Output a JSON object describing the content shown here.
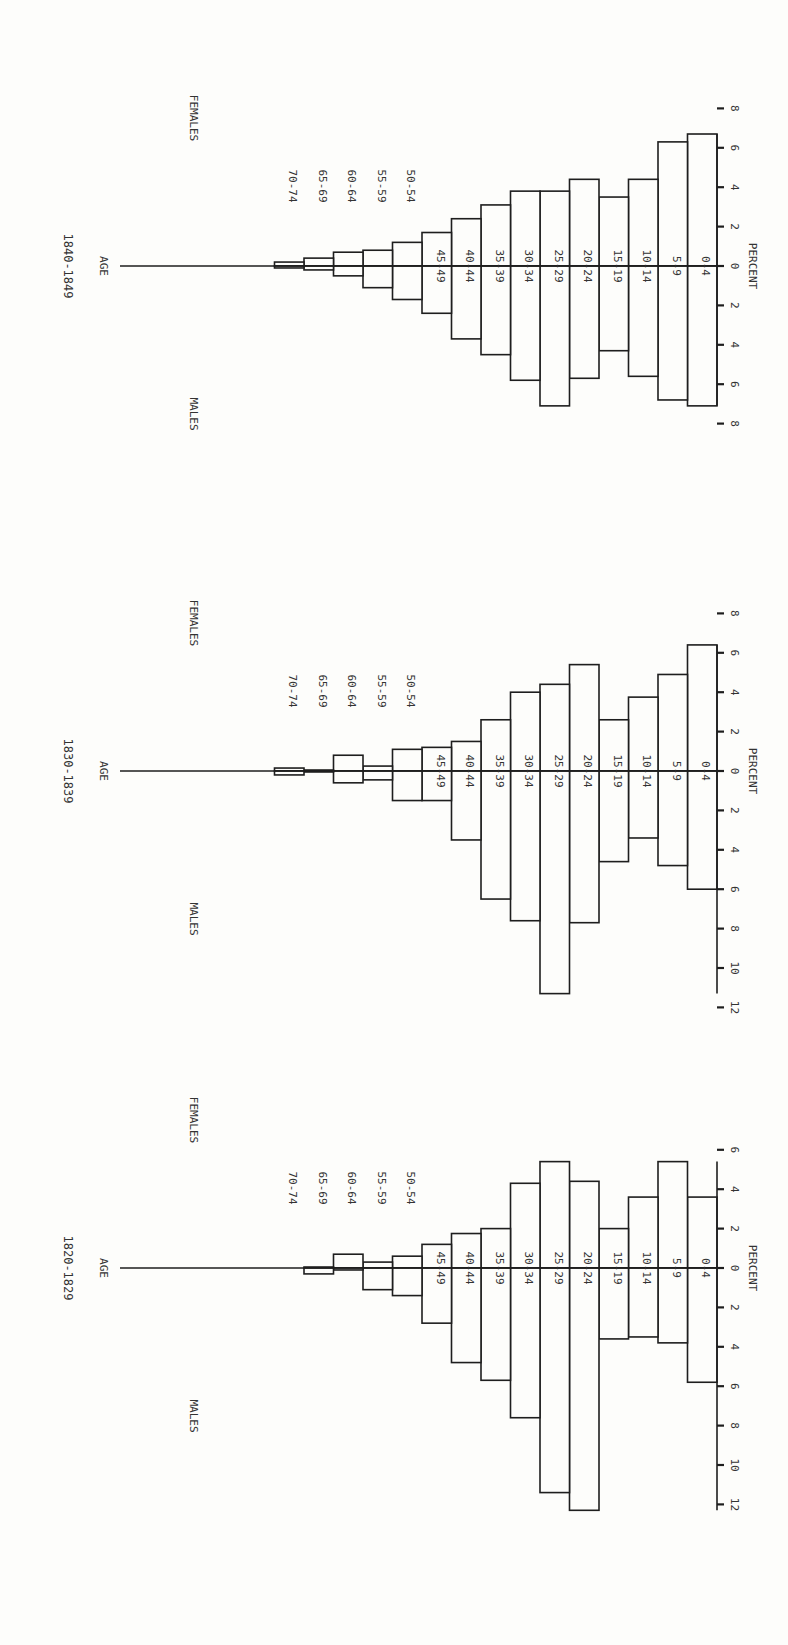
{
  "labels": {
    "age": "AGE",
    "males": "MALES",
    "females": "FEMALES",
    "percent": "PERCENT"
  },
  "chart_data": [
    {
      "type": "bar",
      "subtype": "population-pyramid",
      "title": "1840-1849",
      "orientation_note": "page rotated 90° clockwise; age increases toward the left edge, females toward top, males toward bottom",
      "categories": [
        "0-4",
        "5-9",
        "10-14",
        "15-19",
        "20-24",
        "25-29",
        "30-34",
        "35-39",
        "40-44",
        "45-49",
        "50-54",
        "55-59",
        "60-64",
        "65-69",
        "70-74"
      ],
      "series": [
        {
          "name": "MALES",
          "values": [
            7.1,
            6.8,
            5.6,
            4.3,
            5.7,
            7.1,
            5.8,
            4.5,
            3.7,
            2.4,
            1.7,
            1.1,
            0.5,
            0.2,
            0.1
          ]
        },
        {
          "name": "FEMALES",
          "values": [
            6.7,
            6.3,
            4.4,
            3.5,
            4.4,
            3.8,
            3.8,
            3.1,
            2.4,
            1.7,
            1.2,
            0.8,
            0.7,
            0.4,
            0.2
          ]
        }
      ],
      "xlabel": "PERCENT",
      "ylabel": "AGE",
      "male_ticks": [
        2,
        4,
        6,
        8
      ],
      "female_ticks": [
        2,
        4,
        6,
        8
      ],
      "xlim_males": [
        0,
        8
      ],
      "xlim_females": [
        0,
        8
      ],
      "grid": false
    },
    {
      "type": "bar",
      "subtype": "population-pyramid",
      "title": "1830-1839",
      "categories": [
        "0-4",
        "5-9",
        "10-14",
        "15-19",
        "20-24",
        "25-29",
        "30-34",
        "35-39",
        "40-44",
        "45-49",
        "50-54",
        "55-59",
        "60-64",
        "65-69",
        "70-74"
      ],
      "series": [
        {
          "name": "MALES",
          "values": [
            6.0,
            4.8,
            3.4,
            4.6,
            7.7,
            11.3,
            7.6,
            6.5,
            3.5,
            1.5,
            1.5,
            0.45,
            0.6,
            0.05,
            0.2
          ]
        },
        {
          "name": "FEMALES",
          "values": [
            6.4,
            4.9,
            3.75,
            2.6,
            5.4,
            4.4,
            4.0,
            2.6,
            1.5,
            1.2,
            1.1,
            0.25,
            0.8,
            0.05,
            0.15
          ]
        }
      ],
      "xlabel": "PERCENT",
      "ylabel": "AGE",
      "male_ticks": [
        2,
        4,
        6,
        8,
        10,
        12
      ],
      "female_ticks": [
        2,
        4,
        6,
        8
      ],
      "xlim_males": [
        0,
        12
      ],
      "xlim_females": [
        0,
        8
      ],
      "grid": false
    },
    {
      "type": "bar",
      "subtype": "population-pyramid",
      "title": "1820-1829",
      "categories": [
        "0-4",
        "5-9",
        "10-14",
        "15-19",
        "20-24",
        "25-29",
        "30-34",
        "35-39",
        "40-44",
        "45-49",
        "50-54",
        "55-59",
        "60-64",
        "65-69",
        "70-74"
      ],
      "series": [
        {
          "name": "MALES",
          "values": [
            5.8,
            3.8,
            3.5,
            3.6,
            12.3,
            11.4,
            7.6,
            5.7,
            4.8,
            2.8,
            1.4,
            1.1,
            0.1,
            0.3,
            0.0
          ]
        },
        {
          "name": "FEMALES",
          "values": [
            3.6,
            5.4,
            3.6,
            2.0,
            4.4,
            5.4,
            4.3,
            2.0,
            1.75,
            1.2,
            0.6,
            0.3,
            0.7,
            0.05,
            0.0
          ]
        }
      ],
      "xlabel": "PERCENT",
      "ylabel": "AGE",
      "male_ticks": [
        2,
        4,
        6,
        8,
        10,
        12
      ],
      "female_ticks": [
        2,
        4,
        6
      ],
      "xlim_males": [
        0,
        12
      ],
      "xlim_females": [
        0,
        6
      ],
      "grid": false
    }
  ],
  "layout": {
    "panels": [
      {
        "top": 0,
        "axis_y": 266,
        "title_y": 266
      },
      {
        "top": 0,
        "axis_y": 771,
        "title_y": 771
      },
      {
        "top": 0,
        "axis_y": 1268,
        "title_y": 1268
      }
    ],
    "px_per_percent": 19.7,
    "axis_x": 717,
    "bar_width": 29.5,
    "bar_gap": 0,
    "age_axis_left": 120,
    "ink": "#1e1e1e",
    "paper": "#fdfdfb"
  }
}
